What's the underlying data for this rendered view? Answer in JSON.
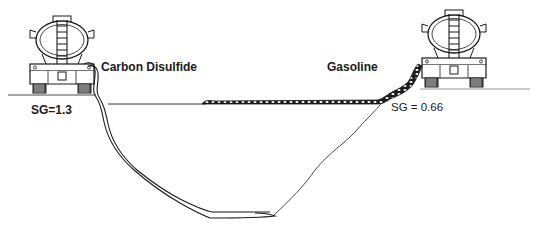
{
  "diagram": {
    "left_truck": {
      "liquid": "Carbon Disulfide",
      "specific_gravity_label": "SG=1.3",
      "behavior": "sinks through subsurface to bottom of basin"
    },
    "right_truck": {
      "liquid": "Gasoline",
      "specific_gravity_label": "SG = 0.66",
      "behavior": "floats and spreads along the surface"
    },
    "colors": {
      "ink": "#1a1a1a",
      "background": "#ffffff"
    }
  }
}
